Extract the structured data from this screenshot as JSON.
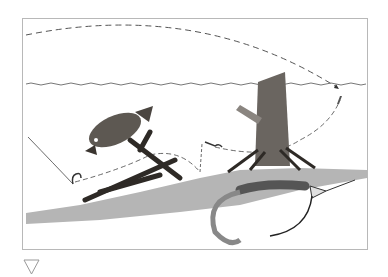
{
  "figure": {
    "elements": [
      "cast-arc",
      "water-surface",
      "bass",
      "submerged-brush",
      "tree-stump",
      "lake-bottom",
      "lure-path",
      "grub-lure-inset"
    ]
  },
  "colors": {
    "border": "#b8b8b8",
    "bottom": "#b5b5b5",
    "ink": "#333333"
  },
  "indicator": {
    "icon": "triangle-down-icon"
  }
}
